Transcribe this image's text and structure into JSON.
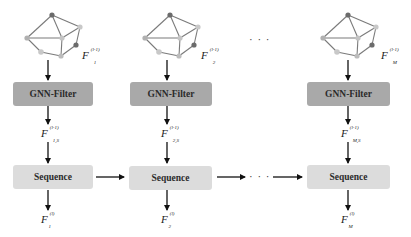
{
  "columns": [
    {
      "graph_label": {
        "base": "F",
        "sub": "1",
        "sup": "(l-1)"
      },
      "filter_label": "GNN-Filter",
      "filtered_label": {
        "base": "F",
        "sub": "1,S",
        "sup": "(l-1)"
      },
      "sequence_label": "Sequence",
      "output_label": {
        "base": "F",
        "sub": "1",
        "sup": "(l)"
      }
    },
    {
      "graph_label": {
        "base": "F",
        "sub": "2",
        "sup": "(l-1)"
      },
      "filter_label": "GNN-Filter",
      "filtered_label": {
        "base": "F",
        "sub": "2,S",
        "sup": "(l-1)"
      },
      "sequence_label": "Sequence",
      "output_label": {
        "base": "F",
        "sub": "2",
        "sup": "(l)"
      }
    },
    {
      "graph_label": {
        "base": "F",
        "sub": "M",
        "sup": "(l-1)"
      },
      "filter_label": "GNN-Filter",
      "filtered_label": {
        "base": "F",
        "sub": "M,S",
        "sup": "(l-1)"
      },
      "sequence_label": "Sequence",
      "output_label": {
        "base": "F",
        "sub": "M",
        "sup": "(l)"
      }
    }
  ],
  "ellipsis": "· · ·",
  "colors": {
    "gnn_filter_box": "#a9a9a9",
    "sequence_box": "#dcdcdc",
    "node_dark": "#6b6b6b",
    "node_light": "#bdbdbd",
    "edge": "#7a7a7a",
    "arrow": "#111111"
  }
}
